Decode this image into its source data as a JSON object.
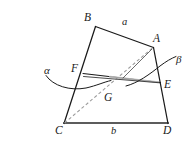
{
  "figure": {
    "kind": "geometry-diagram",
    "width": 195,
    "height": 153,
    "background_color": "#ffffff",
    "stroke_color": "#1a1a1a",
    "dashed_stroke_color": "#8a8a8a",
    "highlight_stroke_color": "#9a9a9a"
  },
  "labels": {
    "vertex_b": "B",
    "vertex_a": "A",
    "vertex_c": "C",
    "vertex_d": "D",
    "point_f": "F",
    "point_e": "E",
    "point_g": "G",
    "side_a": "a",
    "side_b": "b",
    "arc_alpha": "α",
    "arc_beta": "β"
  },
  "geometry": {
    "points": {
      "A": [
        153,
        47
      ],
      "B": [
        95,
        27
      ],
      "C": [
        64,
        123
      ],
      "D": [
        168,
        123
      ],
      "E": [
        160,
        82
      ],
      "F": [
        83,
        74
      ],
      "G": [
        112,
        87
      ]
    },
    "solid_edges": [
      [
        "B",
        "A"
      ],
      [
        "A",
        "D"
      ],
      [
        "C",
        "B"
      ],
      [
        "C",
        "D"
      ],
      [
        "F",
        "E"
      ]
    ],
    "dashed_edges": [
      [
        "C",
        "A"
      ]
    ],
    "arcs": [
      {
        "name": "alpha",
        "from": [
          46,
          77
        ],
        "to": [
          110,
          81
        ]
      },
      {
        "name": "beta",
        "from": [
          128,
          85
        ],
        "to": [
          176,
          57
        ]
      }
    ]
  }
}
